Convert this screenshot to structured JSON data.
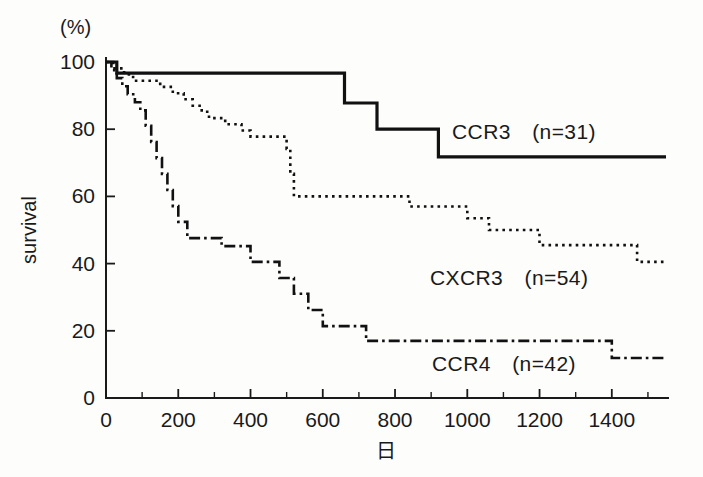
{
  "figure": {
    "background": "#fdfdfc",
    "ink": "#111111"
  },
  "axes": {
    "y_unit_label": "(%)",
    "y_axis_title": "survival",
    "x_axis_title": "日",
    "y_ticks": [
      "0",
      "20",
      "40",
      "60",
      "80",
      "100"
    ],
    "x_ticks": [
      "0",
      "200",
      "400",
      "600",
      "800",
      "1000",
      "1200",
      "1400"
    ]
  },
  "legend": {
    "ccr3_label": "CCR3　(n=31)",
    "cxcr3_label": "CXCR3　(n=54)",
    "ccr4_label": "CCR4　(n=42)"
  },
  "chart_data": {
    "type": "line",
    "subtype": "kaplan-meier-step",
    "title": "",
    "xlabel": "日",
    "ylabel": "survival",
    "yunit": "(%)",
    "xlim": [
      0,
      1550
    ],
    "ylim": [
      0,
      100
    ],
    "xticks": [
      0,
      200,
      400,
      600,
      800,
      1000,
      1200,
      1400
    ],
    "xticks_minor_step": 100,
    "yticks": [
      0,
      20,
      40,
      60,
      80,
      100
    ],
    "grid": false,
    "legend_position": "inline-right-of-curves",
    "series": [
      {
        "name": "CCR3",
        "n": 31,
        "linestyle": "solid",
        "label": "CCR3　(n=31)",
        "steps": [
          {
            "x": 0,
            "y": 100
          },
          {
            "x": 30,
            "y": 100
          },
          {
            "x": 30,
            "y": 96.7
          },
          {
            "x": 660,
            "y": 96.7
          },
          {
            "x": 660,
            "y": 87.8
          },
          {
            "x": 750,
            "y": 87.8
          },
          {
            "x": 750,
            "y": 80.0
          },
          {
            "x": 920,
            "y": 80.0
          },
          {
            "x": 920,
            "y": 71.8
          },
          {
            "x": 1550,
            "y": 71.8
          }
        ],
        "final_value": 71.8
      },
      {
        "name": "CXCR3",
        "n": 54,
        "linestyle": "dotted",
        "label": "CXCR3　(n=54)",
        "steps": [
          {
            "x": 0,
            "y": 100
          },
          {
            "x": 20,
            "y": 100
          },
          {
            "x": 20,
            "y": 98.1
          },
          {
            "x": 50,
            "y": 98.1
          },
          {
            "x": 50,
            "y": 96.3
          },
          {
            "x": 75,
            "y": 96.3
          },
          {
            "x": 75,
            "y": 94.4
          },
          {
            "x": 150,
            "y": 94.4
          },
          {
            "x": 150,
            "y": 92.6
          },
          {
            "x": 185,
            "y": 92.6
          },
          {
            "x": 185,
            "y": 90.7
          },
          {
            "x": 215,
            "y": 90.7
          },
          {
            "x": 215,
            "y": 88.9
          },
          {
            "x": 240,
            "y": 88.9
          },
          {
            "x": 240,
            "y": 87.0
          },
          {
            "x": 265,
            "y": 87.0
          },
          {
            "x": 265,
            "y": 85.2
          },
          {
            "x": 285,
            "y": 85.2
          },
          {
            "x": 285,
            "y": 83.3
          },
          {
            "x": 330,
            "y": 83.3
          },
          {
            "x": 330,
            "y": 81.5
          },
          {
            "x": 375,
            "y": 81.5
          },
          {
            "x": 375,
            "y": 79.6
          },
          {
            "x": 400,
            "y": 79.6
          },
          {
            "x": 400,
            "y": 77.8
          },
          {
            "x": 500,
            "y": 77.8
          },
          {
            "x": 500,
            "y": 74.1
          },
          {
            "x": 510,
            "y": 74.1
          },
          {
            "x": 510,
            "y": 66.7
          },
          {
            "x": 520,
            "y": 66.7
          },
          {
            "x": 520,
            "y": 60.0
          },
          {
            "x": 840,
            "y": 60.0
          },
          {
            "x": 840,
            "y": 57.0
          },
          {
            "x": 1000,
            "y": 57.0
          },
          {
            "x": 1000,
            "y": 53.5
          },
          {
            "x": 1060,
            "y": 53.5
          },
          {
            "x": 1060,
            "y": 50.0
          },
          {
            "x": 1200,
            "y": 50.0
          },
          {
            "x": 1200,
            "y": 45.5
          },
          {
            "x": 1470,
            "y": 45.5
          },
          {
            "x": 1470,
            "y": 40.5
          },
          {
            "x": 1550,
            "y": 40.5
          }
        ],
        "final_value": 40.5
      },
      {
        "name": "CCR4",
        "n": 42,
        "linestyle": "dash-dot",
        "label": "CCR4　(n=42)",
        "steps": [
          {
            "x": 0,
            "y": 100
          },
          {
            "x": 15,
            "y": 100
          },
          {
            "x": 15,
            "y": 97.6
          },
          {
            "x": 30,
            "y": 97.6
          },
          {
            "x": 30,
            "y": 95.2
          },
          {
            "x": 45,
            "y": 95.2
          },
          {
            "x": 45,
            "y": 92.8
          },
          {
            "x": 60,
            "y": 92.8
          },
          {
            "x": 60,
            "y": 90.4
          },
          {
            "x": 80,
            "y": 90.4
          },
          {
            "x": 80,
            "y": 88.0
          },
          {
            "x": 95,
            "y": 88.0
          },
          {
            "x": 95,
            "y": 85.6
          },
          {
            "x": 110,
            "y": 85.6
          },
          {
            "x": 110,
            "y": 81.0
          },
          {
            "x": 125,
            "y": 81.0
          },
          {
            "x": 125,
            "y": 76.2
          },
          {
            "x": 140,
            "y": 76.2
          },
          {
            "x": 140,
            "y": 71.4
          },
          {
            "x": 155,
            "y": 71.4
          },
          {
            "x": 155,
            "y": 66.7
          },
          {
            "x": 170,
            "y": 66.7
          },
          {
            "x": 170,
            "y": 61.9
          },
          {
            "x": 185,
            "y": 61.9
          },
          {
            "x": 185,
            "y": 57.1
          },
          {
            "x": 200,
            "y": 57.1
          },
          {
            "x": 200,
            "y": 52.4
          },
          {
            "x": 225,
            "y": 52.4
          },
          {
            "x": 225,
            "y": 47.6
          },
          {
            "x": 320,
            "y": 47.6
          },
          {
            "x": 320,
            "y": 45.2
          },
          {
            "x": 400,
            "y": 45.2
          },
          {
            "x": 400,
            "y": 40.5
          },
          {
            "x": 480,
            "y": 40.5
          },
          {
            "x": 480,
            "y": 35.7
          },
          {
            "x": 520,
            "y": 35.7
          },
          {
            "x": 520,
            "y": 31.0
          },
          {
            "x": 560,
            "y": 31.0
          },
          {
            "x": 560,
            "y": 26.2
          },
          {
            "x": 600,
            "y": 26.2
          },
          {
            "x": 600,
            "y": 21.4
          },
          {
            "x": 720,
            "y": 21.4
          },
          {
            "x": 720,
            "y": 17.0
          },
          {
            "x": 1400,
            "y": 17.0
          },
          {
            "x": 1400,
            "y": 11.9
          },
          {
            "x": 1550,
            "y": 11.9
          }
        ],
        "final_value": 11.9
      }
    ]
  }
}
